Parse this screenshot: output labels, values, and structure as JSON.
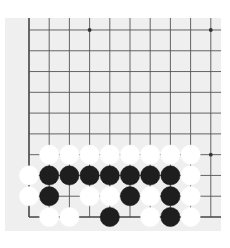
{
  "board": {
    "title": "Go board fragment (lower-left corner region)",
    "background_color": "#efefef",
    "line_color": "#555555",
    "edge_color": "#444444",
    "grid": {
      "columns": 10,
      "rows": 10,
      "left_edge_visible": true,
      "bottom_edge_visible": true,
      "origin_x": 29,
      "bottom_y": 217,
      "col_spacing": 20.2,
      "row_spacing": 20.78
    },
    "star_points": [
      {
        "col": 3,
        "row": 9
      },
      {
        "col": 9,
        "row": 9
      },
      {
        "col": 9,
        "row": 3
      }
    ],
    "stones": [
      {
        "col": 1,
        "row": 3,
        "color": "white"
      },
      {
        "col": 2,
        "row": 3,
        "color": "white"
      },
      {
        "col": 3,
        "row": 3,
        "color": "white"
      },
      {
        "col": 4,
        "row": 3,
        "color": "white"
      },
      {
        "col": 5,
        "row": 3,
        "color": "white"
      },
      {
        "col": 6,
        "row": 3,
        "color": "white"
      },
      {
        "col": 7,
        "row": 3,
        "color": "white"
      },
      {
        "col": 8,
        "row": 3,
        "color": "white"
      },
      {
        "col": 0,
        "row": 2,
        "color": "white"
      },
      {
        "col": 1,
        "row": 2,
        "color": "black"
      },
      {
        "col": 2,
        "row": 2,
        "color": "black"
      },
      {
        "col": 3,
        "row": 2,
        "color": "black"
      },
      {
        "col": 4,
        "row": 2,
        "color": "black"
      },
      {
        "col": 5,
        "row": 2,
        "color": "black"
      },
      {
        "col": 6,
        "row": 2,
        "color": "black"
      },
      {
        "col": 7,
        "row": 2,
        "color": "black"
      },
      {
        "col": 8,
        "row": 2,
        "color": "white"
      },
      {
        "col": 0,
        "row": 1,
        "color": "white"
      },
      {
        "col": 1,
        "row": 1,
        "color": "black"
      },
      {
        "col": 3,
        "row": 1,
        "color": "white"
      },
      {
        "col": 4,
        "row": 1,
        "color": "white"
      },
      {
        "col": 5,
        "row": 1,
        "color": "black"
      },
      {
        "col": 6,
        "row": 1,
        "color": "white"
      },
      {
        "col": 7,
        "row": 1,
        "color": "black"
      },
      {
        "col": 8,
        "row": 1,
        "color": "white"
      },
      {
        "col": 1,
        "row": 0,
        "color": "white"
      },
      {
        "col": 2,
        "row": 0,
        "color": "white"
      },
      {
        "col": 4,
        "row": 0,
        "color": "black"
      },
      {
        "col": 6,
        "row": 0,
        "color": "white"
      },
      {
        "col": 7,
        "row": 0,
        "color": "black"
      },
      {
        "col": 8,
        "row": 0,
        "color": "white"
      }
    ],
    "stone_colors": {
      "black": "#1e1e1e",
      "white": "#ffffff"
    }
  }
}
